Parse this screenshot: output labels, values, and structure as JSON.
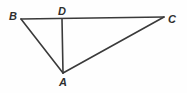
{
  "figure": {
    "kind": "geometry-diagram",
    "canvas": {
      "width": 187,
      "height": 93,
      "background": "#fefefe"
    },
    "stroke": {
      "color": "#3a3a3a",
      "width": 1.6
    },
    "points": [
      {
        "id": "B",
        "label": "B",
        "x": 21,
        "y": 19,
        "label_x": 13,
        "label_y": 16
      },
      {
        "id": "D",
        "label": "D",
        "x": 62,
        "y": 19,
        "label_x": 62,
        "label_y": 11
      },
      {
        "id": "C",
        "label": "C",
        "x": 164,
        "y": 17,
        "label_x": 172,
        "label_y": 19
      },
      {
        "id": "A",
        "label": "A",
        "x": 63,
        "y": 73,
        "label_x": 63,
        "label_y": 82
      }
    ],
    "segments": [
      {
        "id": "BC",
        "from": "B",
        "to": "C",
        "x1": 21,
        "y1": 19,
        "x2": 164,
        "y2": 17
      },
      {
        "id": "BA",
        "from": "B",
        "to": "A",
        "x1": 21,
        "y1": 19,
        "x2": 63,
        "y2": 73
      },
      {
        "id": "AC",
        "from": "A",
        "to": "C",
        "x1": 63,
        "y1": 73,
        "x2": 164,
        "y2": 17
      },
      {
        "id": "DA",
        "from": "D",
        "to": "A",
        "x1": 62,
        "y1": 19,
        "x2": 63,
        "y2": 73
      }
    ],
    "labels": {
      "B": "B",
      "D": "D",
      "C": "C",
      "A": "A"
    }
  }
}
